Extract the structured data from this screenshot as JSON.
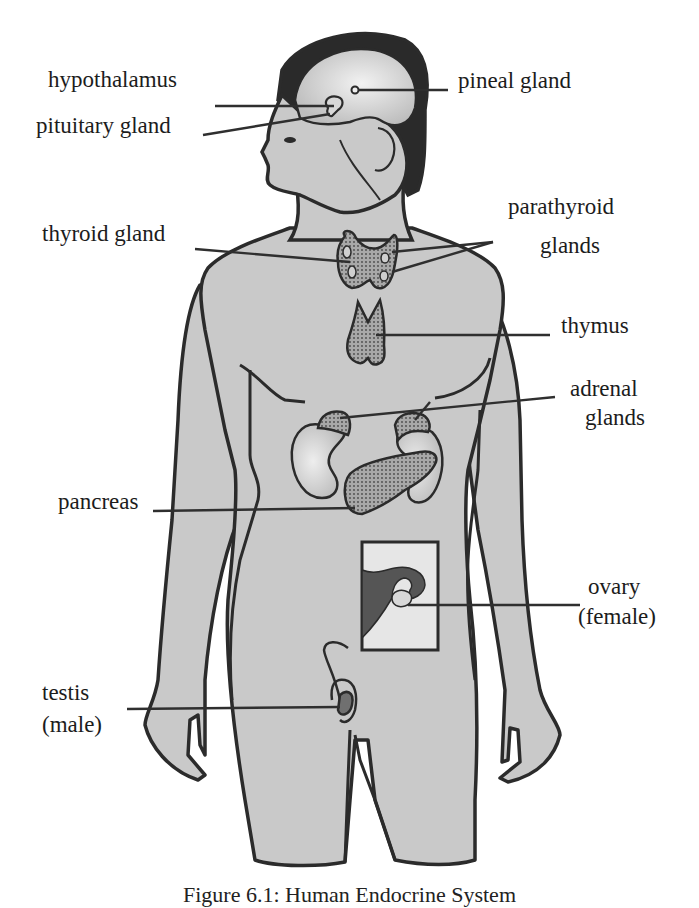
{
  "figure": {
    "caption": "Figure 6.1: Human Endocrine System",
    "colors": {
      "skin": "#c9c9c9",
      "outline": "#2b2b2b",
      "hair": "#2a2a2a",
      "gland_fill": "#8f8f8f",
      "inset_bg": "#e6e6e6",
      "uterus": "#555555",
      "leader_line": "#2f2f2f"
    }
  },
  "labels": {
    "hypothalamus": "hypothalamus",
    "pituitary": "pituitary gland",
    "pineal": "pineal gland",
    "thyroid": "thyroid gland",
    "parathyroid_line1": "parathyroid",
    "parathyroid_line2": "glands",
    "thymus": "thymus",
    "adrenal_line1": "adrenal",
    "adrenal_line2": "glands",
    "pancreas": "pancreas",
    "ovary_line1": "ovary",
    "ovary_line2": "(female)",
    "testis_line1": "testis",
    "testis_line2": "(male)"
  }
}
